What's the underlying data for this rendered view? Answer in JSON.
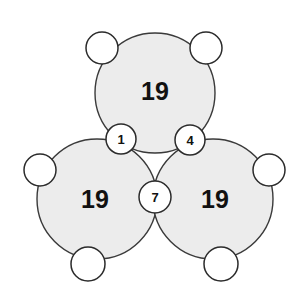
{
  "figure": {
    "type": "circle-sum-puzzle-diagram",
    "background_color": "#ffffff",
    "big_circle_fill": "#ececec",
    "big_circle_stroke": "#3a3a3a",
    "node_fill": "#ffffff",
    "node_stroke": "#2b2b2b",
    "label_color": "#111111"
  },
  "big_circles": [
    {
      "id": "top",
      "label": "19",
      "cx": 155,
      "cy": 93,
      "r": 60,
      "label_x": 155,
      "label_y": 91
    },
    {
      "id": "bottom-left",
      "label": "19",
      "cx": 97,
      "cy": 199,
      "r": 60,
      "label_x": 95,
      "label_y": 199
    },
    {
      "id": "bottom-right",
      "label": "19",
      "cx": 213,
      "cy": 199,
      "r": 60,
      "label_x": 215,
      "label_y": 199
    }
  ],
  "nodes": [
    {
      "id": "node-top-left",
      "label": "",
      "cx": 102,
      "cy": 48,
      "r": 16
    },
    {
      "id": "node-top-right",
      "label": "",
      "cx": 206,
      "cy": 48,
      "r": 16
    },
    {
      "id": "node-one",
      "label": "1",
      "cx": 121,
      "cy": 139,
      "r": 15
    },
    {
      "id": "node-four",
      "label": "4",
      "cx": 190,
      "cy": 140,
      "r": 15
    },
    {
      "id": "node-left",
      "label": "",
      "cx": 40,
      "cy": 170,
      "r": 16
    },
    {
      "id": "node-right",
      "label": "",
      "cx": 269,
      "cy": 170,
      "r": 16
    },
    {
      "id": "node-seven",
      "label": "7",
      "cx": 155,
      "cy": 197,
      "r": 16
    },
    {
      "id": "node-bottom-left",
      "label": "",
      "cx": 88,
      "cy": 264,
      "r": 17
    },
    {
      "id": "node-bottom-right",
      "label": "",
      "cx": 221,
      "cy": 264,
      "r": 17
    }
  ]
}
